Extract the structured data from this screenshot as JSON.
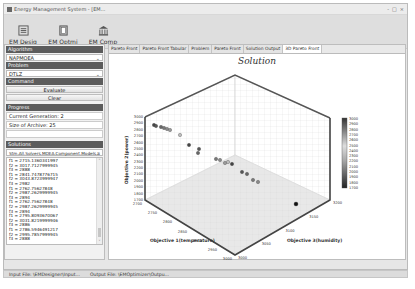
{
  "window": {
    "title": "Energy Management System - [EM...",
    "controls": [
      "-",
      "□",
      "×"
    ]
  },
  "toolbar": {
    "items": [
      {
        "label": "EM Desig",
        "icon": "design-icon"
      },
      {
        "label": "EM Optmi",
        "icon": "optimize-icon"
      },
      {
        "label": "EM Comp",
        "icon": "compare-icon"
      }
    ]
  },
  "left_panel": {
    "algorithm_header": "Algorithm",
    "algorithm_value": "NAPMOEA",
    "problem_header": "Problem",
    "problem_value": "DTLZ",
    "command_header": "Command",
    "evaluate_label": "Evaluate",
    "clear_label": "Clear",
    "progress_header": "Progress",
    "current_generation": "Current Generation: 2",
    "size_of_archive": "Size of Archive: 25",
    "blank_field": "",
    "solutions_header": "Solutions",
    "solutions_select": "Stm.All.Solvers.MOEA.Component.Models.S",
    "solutions_list": [
      "f1 = 2715.1360341997",
      "f2 = 3017.7127999945",
      "f3 = 2888",
      "f1 = 2841.7478776715",
      "f2 = 3043.8723999947",
      "f3 = 2982",
      "f1 = 2762.75627848",
      "f2 = 2987.2629999945",
      "f3 = 2894",
      "f1 = 2762.75627848",
      "f2 = 2987.2629999945",
      "f3 = 2894",
      "f1 = 2795.8093670067",
      "f2 = 3031.8219999946",
      "f3 = 2886",
      "f1 = 2786.5946491217",
      "f2 = 2995.7857999945",
      "f3 = 2888"
    ]
  },
  "tabs": [
    {
      "label": "Pareto Front",
      "active": false
    },
    {
      "label": "Pareto Front Tabular",
      "active": false
    },
    {
      "label": "Problem",
      "active": false
    },
    {
      "label": "Pareto Front",
      "active": false
    },
    {
      "label": "Solution Output",
      "active": false
    },
    {
      "label": "3D Pareto Front",
      "active": true
    }
  ],
  "status_bar": {
    "input_file": "Input File: \\EMDesigner\\Input...",
    "output_file": "Output File: \\EMOptimizer\\Outpu..."
  },
  "chart_data": {
    "type": "scatter",
    "title": "Solution",
    "xlabel": "Objective 1(temperature)",
    "ylabel": "Objective 3(humidity)",
    "zlabel": "Objective 2(power)",
    "x_ticks": [
      "2700",
      "2750",
      "2800",
      "2850",
      "2900",
      "2950",
      "3000"
    ],
    "y_ticks": [
      "3000",
      "3050",
      "3100",
      "3150",
      "3200"
    ],
    "z_ticks": [
      "1700",
      "1800",
      "1900",
      "2000",
      "2100",
      "2200",
      "2300",
      "2400",
      "2500",
      "2600",
      "2700",
      "2800",
      "2900",
      "3000"
    ],
    "colorbar_ticks": [
      "3000",
      "2900",
      "2800",
      "2700",
      "2600",
      "2500",
      "2400",
      "2300",
      "2200",
      "2100",
      "2000",
      "1900",
      "1800",
      "1700"
    ],
    "grid": true,
    "points_screen": [
      {
        "x": 154,
        "y": 125
      },
      {
        "x": 156,
        "y": 126
      },
      {
        "x": 161,
        "y": 127
      },
      {
        "x": 164,
        "y": 128
      },
      {
        "x": 167,
        "y": 129
      },
      {
        "x": 170,
        "y": 130
      },
      {
        "x": 180,
        "y": 135
      },
      {
        "x": 189,
        "y": 145
      },
      {
        "x": 199,
        "y": 149
      },
      {
        "x": 198,
        "y": 153
      },
      {
        "x": 216,
        "y": 159
      },
      {
        "x": 220,
        "y": 160
      },
      {
        "x": 225,
        "y": 163
      },
      {
        "x": 228,
        "y": 162
      },
      {
        "x": 232,
        "y": 164
      },
      {
        "x": 242,
        "y": 172
      },
      {
        "x": 247,
        "y": 174
      },
      {
        "x": 253,
        "y": 180
      },
      {
        "x": 258,
        "y": 182
      },
      {
        "x": 296,
        "y": 204
      }
    ]
  }
}
